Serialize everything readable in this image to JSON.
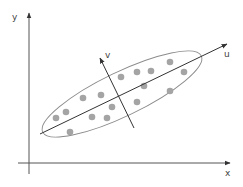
{
  "diagram": {
    "type": "pca-scatter",
    "axes": {
      "x_label": "x",
      "y_label": "y"
    },
    "principal_axes": {
      "u_label": "u",
      "v_label": "v"
    },
    "colors": {
      "axis": "#555555",
      "ellipse": "#8a8a8a",
      "dot": "#a4a4a4",
      "principal_axis": "#333333"
    },
    "points": [
      {
        "x": 56,
        "y": 118
      },
      {
        "x": 66,
        "y": 112
      },
      {
        "x": 70,
        "y": 132
      },
      {
        "x": 83,
        "y": 98
      },
      {
        "x": 92,
        "y": 117
      },
      {
        "x": 101,
        "y": 95
      },
      {
        "x": 107,
        "y": 118
      },
      {
        "x": 112,
        "y": 107
      },
      {
        "x": 121,
        "y": 77
      },
      {
        "x": 137,
        "y": 72
      },
      {
        "x": 151,
        "y": 71
      },
      {
        "x": 170,
        "y": 62
      },
      {
        "x": 184,
        "y": 72
      },
      {
        "x": 144,
        "y": 86
      },
      {
        "x": 170,
        "y": 91
      },
      {
        "x": 137,
        "y": 102
      }
    ]
  }
}
